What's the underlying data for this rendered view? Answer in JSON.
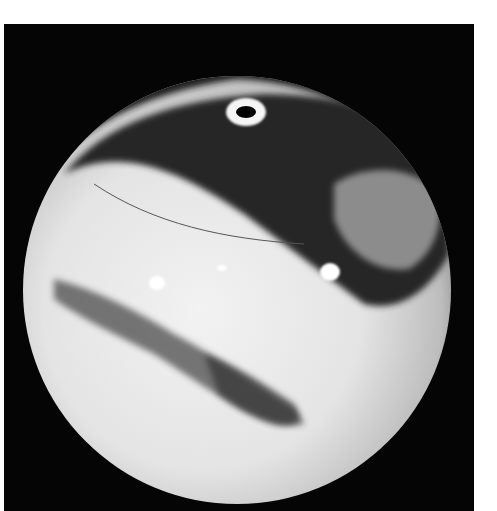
{
  "image": {
    "subject": "sphere",
    "background_color": "#050505",
    "margin_color": "#ffffff",
    "sphere_base_color": "#e6e6e6",
    "dark_band_color": "#2a2a2a"
  }
}
